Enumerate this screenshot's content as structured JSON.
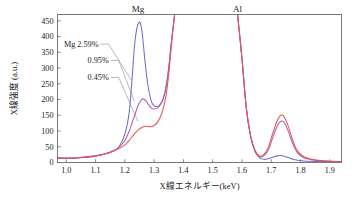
{
  "chart_data": {
    "type": "line",
    "title": "",
    "xlabel": "X線エネルギー(keV)",
    "ylabel": "X線強度 (a.u.)",
    "xlim": [
      0.97,
      1.94
    ],
    "ylim": [
      0,
      470
    ],
    "xticks": [
      "1.0",
      "1.1",
      "1.2",
      "1.3",
      "1.4",
      "1.5",
      "1.6",
      "1.7",
      "1.8",
      "1.9"
    ],
    "xtick_values": [
      1.0,
      1.1,
      1.2,
      1.3,
      1.4,
      1.5,
      1.6,
      1.7,
      1.8,
      1.9
    ],
    "yticks": [
      "0",
      "50",
      "100",
      "150",
      "200",
      "250",
      "300",
      "350",
      "400",
      "450"
    ],
    "ytick_values": [
      0,
      50,
      100,
      150,
      200,
      250,
      300,
      350,
      400,
      450
    ],
    "grid": false,
    "legend_position": "inside-left-annotations",
    "annotations": [
      {
        "name": "mg-peak-label",
        "text": "Mg",
        "x": 1.245,
        "y": 470
      },
      {
        "name": "al-peak-label",
        "text": "Al",
        "x": 1.585,
        "y": 470
      }
    ],
    "series": [
      {
        "name": "Mg 2.59%",
        "label": "Mg 2.59%",
        "color": "#6f6fc4",
        "mg_peak_energy": 1.248,
        "mg_peak_value": 445,
        "al_peak_energy": 1.732,
        "al_peak_value": 22,
        "x": [
          0.97,
          1.0,
          1.05,
          1.1,
          1.13,
          1.16,
          1.18,
          1.2,
          1.215,
          1.225,
          1.235,
          1.248,
          1.258,
          1.268,
          1.278,
          1.29,
          1.3,
          1.31,
          1.32,
          1.33,
          1.34,
          1.35,
          1.36,
          1.37,
          1.585,
          1.6,
          1.615,
          1.63,
          1.645,
          1.66,
          1.675,
          1.69,
          1.705,
          1.72,
          1.732,
          1.745,
          1.76,
          1.775,
          1.79,
          1.81,
          1.83,
          1.86,
          1.9,
          1.94
        ],
        "y": [
          14,
          13,
          15,
          20,
          26,
          36,
          50,
          90,
          160,
          270,
          390,
          445,
          420,
          330,
          250,
          196,
          180,
          178,
          184,
          200,
          235,
          300,
          390,
          470,
          470,
          330,
          170,
          80,
          34,
          15,
          10,
          12,
          17,
          21,
          22,
          20,
          15,
          10,
          7,
          5,
          4,
          3,
          3,
          3
        ]
      },
      {
        "name": "0.95%",
        "label": "0.95%",
        "color": "#b05ab0",
        "mg_peak_energy": 1.262,
        "mg_peak_value": 202,
        "al_peak_energy": 1.733,
        "al_peak_value": 131,
        "x": [
          0.97,
          1.0,
          1.05,
          1.1,
          1.13,
          1.16,
          1.18,
          1.2,
          1.215,
          1.23,
          1.245,
          1.255,
          1.262,
          1.272,
          1.282,
          1.292,
          1.3,
          1.31,
          1.32,
          1.33,
          1.34,
          1.35,
          1.36,
          1.37,
          1.585,
          1.6,
          1.615,
          1.63,
          1.645,
          1.66,
          1.675,
          1.69,
          1.705,
          1.72,
          1.733,
          1.745,
          1.76,
          1.775,
          1.79,
          1.81,
          1.83,
          1.86,
          1.9,
          1.94
        ],
        "y": [
          15,
          14,
          16,
          21,
          27,
          37,
          48,
          70,
          100,
          140,
          180,
          197,
          202,
          196,
          182,
          172,
          170,
          172,
          182,
          200,
          236,
          302,
          392,
          470,
          470,
          330,
          172,
          82,
          36,
          18,
          22,
          40,
          78,
          115,
          131,
          126,
          95,
          56,
          30,
          16,
          10,
          6,
          4,
          3
        ]
      },
      {
        "name": "0.45%",
        "label": "0.45%",
        "color": "#e3584f",
        "mg_peak_energy": 1.272,
        "mg_peak_value": 115,
        "al_peak_energy": 1.733,
        "al_peak_value": 150,
        "x": [
          0.97,
          1.0,
          1.05,
          1.1,
          1.13,
          1.16,
          1.18,
          1.2,
          1.215,
          1.23,
          1.245,
          1.26,
          1.272,
          1.282,
          1.292,
          1.3,
          1.31,
          1.32,
          1.33,
          1.34,
          1.35,
          1.36,
          1.37,
          1.585,
          1.6,
          1.615,
          1.63,
          1.645,
          1.66,
          1.675,
          1.69,
          1.705,
          1.72,
          1.733,
          1.745,
          1.76,
          1.775,
          1.79,
          1.81,
          1.83,
          1.86,
          1.9,
          1.94
        ],
        "y": [
          15,
          14,
          16,
          21,
          27,
          36,
          44,
          56,
          70,
          88,
          103,
          112,
          115,
          114,
          114,
          118,
          126,
          142,
          168,
          210,
          280,
          380,
          470,
          470,
          332,
          174,
          84,
          38,
          20,
          26,
          48,
          92,
          132,
          150,
          144,
          110,
          66,
          36,
          19,
          12,
          7,
          4,
          3
        ]
      }
    ],
    "series_annotations": [
      {
        "name": "series-annotation-259",
        "text": "Mg 2.59%",
        "label_x": 1.11,
        "label_y": 368,
        "target_x": 1.222,
        "target_y": 262
      },
      {
        "name": "series-annotation-095",
        "text": "0.95%",
        "label_x": 1.145,
        "label_y": 316,
        "target_x": 1.232,
        "target_y": 196
      },
      {
        "name": "series-annotation-045",
        "text": "0.45%",
        "label_x": 1.145,
        "label_y": 262,
        "target_x": 1.245,
        "target_y": 130
      }
    ]
  }
}
